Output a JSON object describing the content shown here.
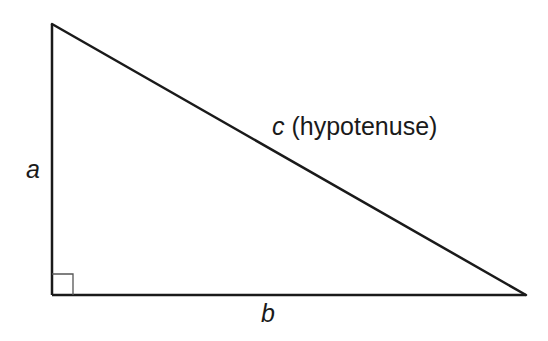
{
  "diagram": {
    "type": "right-triangle",
    "labels": {
      "side_a": "a",
      "side_b": "b",
      "side_c_var": "c",
      "side_c_desc": " (hypotenuse)"
    },
    "colors": {
      "stroke": "#1a1a1a",
      "right_angle_marker": "#555555",
      "background": "#ffffff"
    }
  }
}
